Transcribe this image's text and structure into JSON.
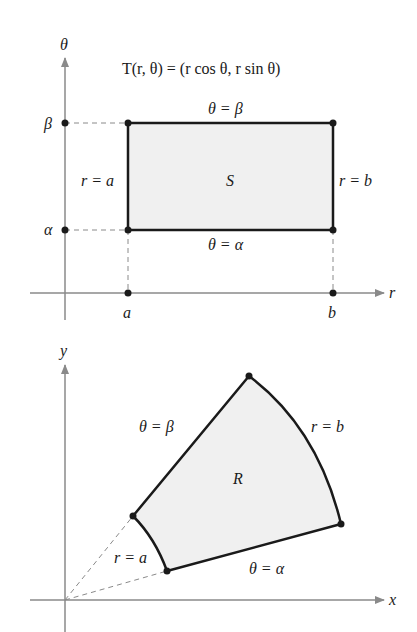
{
  "top_plot": {
    "formula": "T(r, θ) = (r cos θ, r sin θ)",
    "axis_vertical_label": "θ",
    "axis_horizontal_label": "r",
    "tick_beta": "β",
    "tick_alpha": "α",
    "tick_a": "a",
    "tick_b": "b",
    "region_label": "S",
    "edge_top": "θ = β",
    "edge_bottom": "θ = α",
    "edge_left": "r = a",
    "edge_right": "r = b",
    "fill_color": "#f0f0f0",
    "edge_color": "#1a1a1a",
    "axis_color": "#8a8a8a"
  },
  "bottom_plot": {
    "axis_vertical_label": "y",
    "axis_horizontal_label": "x",
    "region_label": "R",
    "edge_upper": "θ = β",
    "edge_lower": "θ = α",
    "edge_inner": "r = a",
    "edge_outer": "r = b",
    "fill_color": "#f0f0f0"
  }
}
